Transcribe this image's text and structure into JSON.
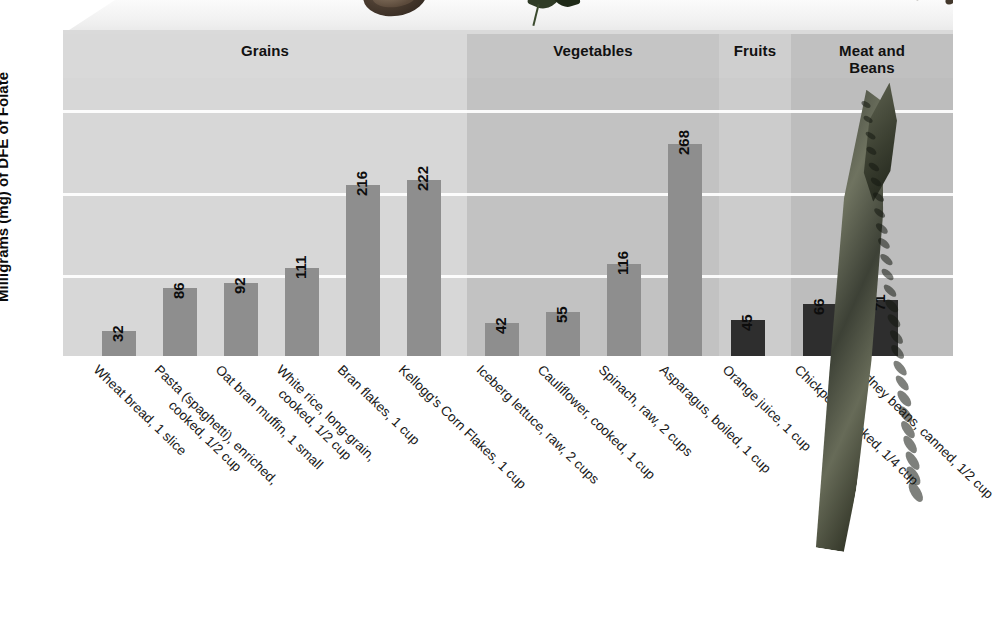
{
  "chart_data": {
    "type": "bar",
    "title": "",
    "xlabel": "",
    "ylabel": "Milligrams (mg) of DFE of Folate",
    "ylim": [
      0,
      320
    ],
    "grid": true,
    "gridlines": [
      100,
      200,
      300
    ],
    "legend": "none",
    "categories": [
      "Wheat bread, 1 slice",
      "Pasta (spaghetti), enriched,\ncooked, 1/2 cup",
      "Oat bran muffin, 1 small",
      "White rice, long-grain,\ncooked, 1/2 cup",
      "Bran flakes, 1 cup",
      "Kellogg's Corn Flakes, 1 cup",
      "Iceberg lettuce, raw, 2 cups",
      "Cauliflower, cooked, 1 cup",
      "Spinach, raw, 2 cups",
      "Asparagus, boiled, 1 cup",
      "Orange juice, 1 cup",
      "Chickpeas, cooked, 1/4 cup",
      "Kidney beans, canned, 1/2 cup"
    ],
    "values": [
      32,
      86,
      92,
      111,
      216,
      222,
      42,
      55,
      116,
      268,
      45,
      66,
      71
    ],
    "groups": [
      {
        "label": "Grains",
        "count": 6,
        "color": "#8e8e8e",
        "panel": "#d7d7d7"
      },
      {
        "label": "Vegetables",
        "count": 4,
        "color": "#8e8e8e",
        "panel": "#c2c2c2"
      },
      {
        "label": "Fruits",
        "count": 1,
        "color": "#2e2e2e",
        "panel": "#cccccc"
      },
      {
        "label": "Meat and\nBeans",
        "count": 2,
        "color": "#2e2e2e",
        "panel": "#bdbdbd"
      }
    ]
  },
  "axis": {
    "y_title": "Milligrams (mg) of DFE of Folate"
  },
  "groups": {
    "grains": "Grains",
    "vegetables": "Vegetables",
    "fruits": "Fruits",
    "meat": "Meat and Beans"
  },
  "colors": {
    "bar_light": "#8e8e8e",
    "bar_dark": "#2e2e2e",
    "gridline": "#ffffff",
    "panel_grains": "#d7d7d7",
    "panel_vegetables": "#c2c2c2",
    "panel_fruits": "#cccccc",
    "panel_meat": "#bdbdbd",
    "text": "#111111"
  },
  "decorations": [
    {
      "name": "bread-roll-photo"
    },
    {
      "name": "spinach-leaves-photo"
    },
    {
      "name": "beans-photo"
    },
    {
      "name": "asparagus-spear-photo"
    }
  ]
}
